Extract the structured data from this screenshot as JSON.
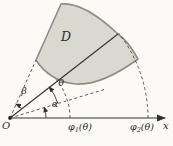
{
  "figure": {
    "description_labels": {
      "origin": "O",
      "x_axis": "x",
      "region": "D",
      "alpha": "α",
      "beta": "β",
      "theta": "θ",
      "phi1": {
        "base": "φ",
        "sub": "1",
        "arg": "(θ)"
      },
      "phi2": {
        "base": "φ",
        "sub": "2",
        "arg": "(θ)"
      }
    },
    "colors": {
      "background": "#fbfaf7",
      "region_fill": "#d9d8d1",
      "region_stroke": "#8e8d85",
      "line": "#33322f",
      "dashed_line": "#4c4b47"
    }
  }
}
